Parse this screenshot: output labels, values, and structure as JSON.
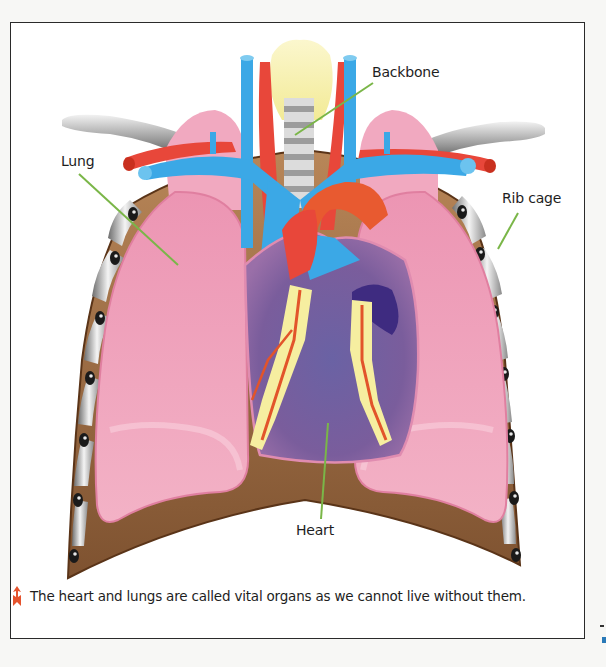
{
  "figure": {
    "labels": {
      "backbone": "Backbone",
      "lung": "Lung",
      "rib_cage": "Rib cage",
      "heart": "Heart"
    },
    "caption": "The heart and lungs are called vital organs as we cannot live without them.",
    "caption_icon": "arrow-up-icon",
    "colors": {
      "frame_border": "#2a2a2a",
      "leader_line": "#7ab648",
      "lung": "#f0a0b8",
      "vein_blue": "#3ba8e6",
      "artery_red": "#e8473a",
      "heart_purple": "#6e5a9a",
      "fat_yellow": "#f6eea0",
      "diaphragm_brown": "#9a6a3e",
      "caption_arrow": "#e5532d"
    }
  }
}
